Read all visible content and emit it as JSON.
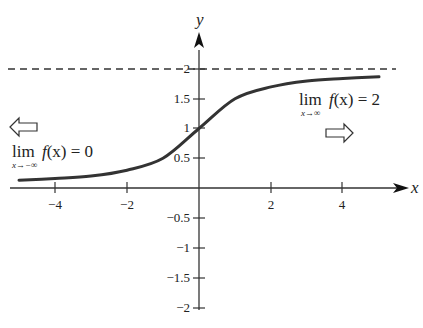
{
  "chart_data": {
    "type": "line",
    "title": "",
    "xlabel": "x",
    "ylabel": "y",
    "xlim": [
      -5.3,
      5.8
    ],
    "ylim": [
      -2,
      2.4
    ],
    "grid": false,
    "x_ticks": [
      -4,
      -2,
      2,
      4
    ],
    "x_tick_labels": [
      "−4",
      "−2",
      "2",
      "4"
    ],
    "y_ticks": [
      2,
      1.5,
      1,
      0.5,
      -0.5,
      -1,
      -1.5,
      -2
    ],
    "y_tick_labels": [
      "2",
      "1.5",
      "1",
      "0.5",
      "−0.5",
      "−1",
      "−1.5",
      "−2"
    ],
    "series": [
      {
        "name": "f(x)",
        "x": [
          -5,
          -4,
          -3,
          -2,
          -1,
          0,
          1,
          2,
          3,
          4,
          5
        ],
        "values": [
          0.13,
          0.16,
          0.2,
          0.3,
          0.5,
          1.0,
          1.5,
          1.7,
          1.8,
          1.84,
          1.87
        ]
      }
    ],
    "asymptote": {
      "y": 2,
      "style": "dashed"
    },
    "annotations": [
      {
        "text": "lim f(x) = 0",
        "subscript": "x→−∞",
        "arrow": "left"
      },
      {
        "text": "lim f(x) = 2",
        "subscript": "x→∞",
        "arrow": "right"
      }
    ]
  },
  "axes": {
    "x_label": "x",
    "y_label": "y"
  },
  "annotations": {
    "left": {
      "lim": "lim",
      "func": "f",
      "arg": "(x) = 0",
      "sub": "x→−∞"
    },
    "right": {
      "lim": "lim",
      "func": "f",
      "arg": "(x) = 2",
      "sub": "x→∞"
    }
  }
}
